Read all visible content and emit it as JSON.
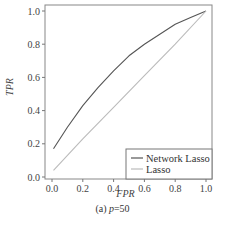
{
  "chart_data": {
    "type": "line",
    "title": "",
    "xlabel": "FPR",
    "ylabel": "TPR",
    "xlim": [
      0.0,
      1.0
    ],
    "ylim": [
      0.0,
      1.0
    ],
    "xticks": [
      "0.0",
      "0.2",
      "0.4",
      "0.6",
      "0.8",
      "1.0"
    ],
    "yticks": [
      "0.0",
      "0.2",
      "0.4",
      "0.6",
      "0.8",
      "1.0"
    ],
    "grid": false,
    "legend_position": "lower right",
    "series": [
      {
        "name": "Network Lasso",
        "color": "#555555",
        "x": [
          0.01,
          0.1,
          0.2,
          0.3,
          0.4,
          0.5,
          0.6,
          0.7,
          0.8,
          0.9,
          1.0
        ],
        "y": [
          0.17,
          0.3,
          0.43,
          0.54,
          0.64,
          0.73,
          0.8,
          0.86,
          0.92,
          0.96,
          1.0
        ]
      },
      {
        "name": "Lasso",
        "color": "#bbbbbb",
        "x": [
          0.01,
          0.2,
          0.4,
          0.6,
          0.8,
          1.0
        ],
        "y": [
          0.04,
          0.23,
          0.42,
          0.61,
          0.8,
          1.0
        ]
      }
    ]
  },
  "caption": {
    "prefix": "(a) ",
    "variable": "p",
    "suffix": "=50"
  }
}
